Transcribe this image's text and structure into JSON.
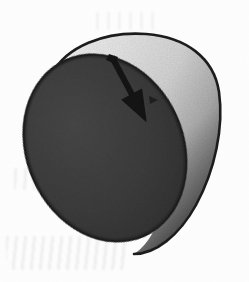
{
  "figure": {
    "title": "Cylindrical disc with direction arrow",
    "medium": "scanned halftone print",
    "background_color": "#fdfdfd"
  },
  "shapes": {
    "front_face": {
      "name": "front circular face",
      "render_shape": "ellipse",
      "fill_color": "#3a3a3a",
      "stroke_color": "#1a1a1a",
      "center_x": 105,
      "center_y": 148,
      "radius_x": 78,
      "radius_y": 96,
      "rotation_deg": -24
    },
    "lateral_surface": {
      "name": "curved side wall of the cylinder",
      "render_shape": "swept band",
      "fill_light": "#e3e3e3",
      "fill_mid": "#c2c2c2",
      "fill_dark": "#5a5a5a",
      "stroke_color": "#1f1f1f"
    },
    "back_rim": {
      "name": "far rim arc",
      "stroke_color": "#1f1f1f"
    }
  },
  "arrow": {
    "name": "direction arrow",
    "color": "#141414",
    "tail_x": 112,
    "tail_y": 57,
    "tip_x": 146,
    "tip_y": 121,
    "head_length": 30,
    "head_width": 22,
    "shaft_width": 6,
    "direction": "down-right"
  },
  "palette": {
    "paper": "#fdfdfd",
    "ink": "#141414",
    "dark_face": "#3a3a3a",
    "light_side": "#dcdcdc",
    "shadow_side": "#585858",
    "outline": "#1f1f1f"
  }
}
